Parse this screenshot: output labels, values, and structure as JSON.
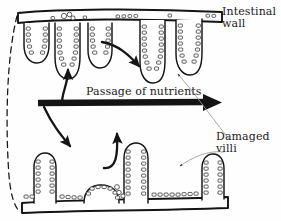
{
  "figure": {
    "kind": "biology-diagram",
    "ink_color": "#141414",
    "pointer_color": "#8a8a8a",
    "background": "#fefefe"
  },
  "labels": {
    "intestinal_wall": "Intestinal\nwall",
    "damaged_villi": "Damaged\nvilli",
    "passage_of_nutrients": "Passage of nutrients"
  },
  "annotations": {
    "main_arrow_name": "passage-of-nutrients-arrow",
    "main_arrow_direction": "right",
    "curved_arrows": [
      {
        "name": "arrow-up-into-healthy-villi",
        "direction": "up"
      },
      {
        "name": "arrow-down-into-damaged-villi",
        "direction": "down-right"
      },
      {
        "name": "arrow-within-healthy-villi",
        "direction": "down-right"
      },
      {
        "name": "arrow-up-from-damaged-villi",
        "direction": "up"
      }
    ],
    "pointer_lines": [
      {
        "name": "pointer-to-healthy-villus",
        "from": "damaged-villi-label"
      },
      {
        "name": "pointer-to-damaged-villus",
        "from": "damaged-villi-label"
      }
    ],
    "lumen_boundary": "dashed-left-boundary"
  },
  "structures": {
    "top_wall_name": "intestinal-wall-top",
    "bottom_wall_name": "intestinal-wall-bottom",
    "healthy_villi_count": 5,
    "damaged_villi_count": 4,
    "cell_shape": "rounded-rectangle"
  }
}
